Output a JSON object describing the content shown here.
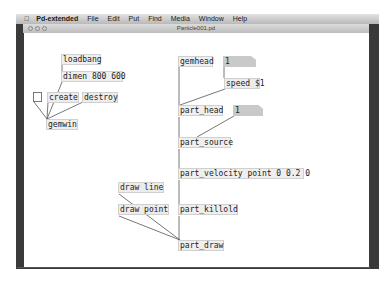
{
  "menubar": {
    "apple_icon": "apple-icon",
    "app_name": "Pd-extended",
    "items": [
      "File",
      "Edit",
      "Put",
      "Find",
      "Media",
      "Window",
      "Help"
    ]
  },
  "window": {
    "title": "Particle001.pd",
    "traffic_lights": [
      "close",
      "minimize",
      "zoom"
    ]
  },
  "patch": {
    "objects": {
      "loadbang": "loadbang",
      "dimen": "dimen 800 600",
      "create": "create",
      "destroy": "destroy",
      "gemwin": "gemwin",
      "gemhead": "gemhead",
      "num1": "1",
      "speed": "speed $1",
      "part_head": "part_head",
      "num2": "1",
      "part_source": "part_source",
      "part_velocity": "part_velocity point 0 0.2 0",
      "part_killold": "part_killold",
      "draw_line": "draw line",
      "draw_point": "draw point",
      "part_draw": "part_draw"
    },
    "toggle_state": "off"
  },
  "colors": {
    "object_bg": "#efefef",
    "numbox_bg": "#c9c9c9",
    "wire": "#555555"
  }
}
